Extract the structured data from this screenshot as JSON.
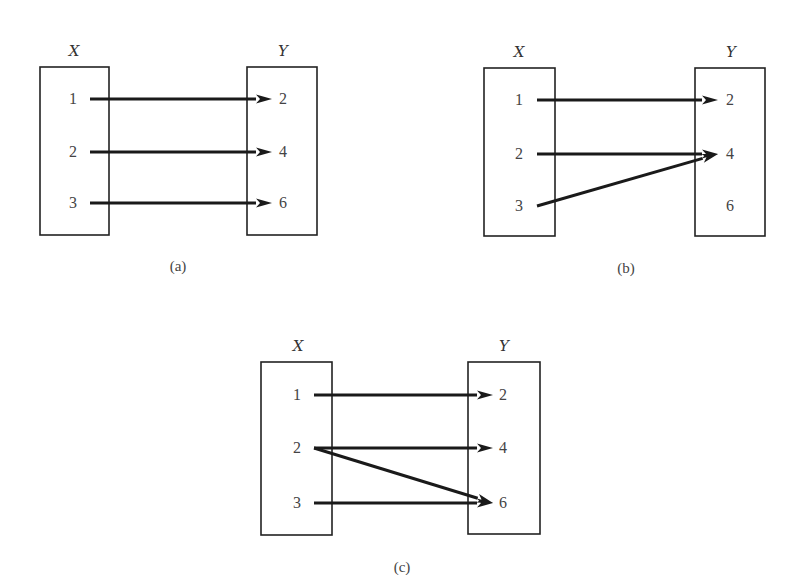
{
  "figure": {
    "background": "#ffffff",
    "line_color": "#1a1a1a",
    "panels": [
      {
        "id": "a",
        "caption": "(a)",
        "caption_pos": [
          178,
          271
        ],
        "domain": {
          "label": "X",
          "box": [
            40,
            67,
            69,
            168
          ],
          "label_pos": [
            74,
            56
          ],
          "elements": [
            {
              "v": "1",
              "y": 99
            },
            {
              "v": "2",
              "y": 152
            },
            {
              "v": "3",
              "y": 203
            }
          ],
          "elem_x": 73
        },
        "codomain": {
          "label": "Y",
          "box": [
            247,
            67,
            70,
            168
          ],
          "label_pos": [
            283,
            56
          ],
          "elements": [
            {
              "v": "2",
              "y": 99
            },
            {
              "v": "4",
              "y": 152
            },
            {
              "v": "6",
              "y": 203
            }
          ],
          "elem_x": 283
        },
        "mappings": [
          {
            "from": "1",
            "to": "2"
          },
          {
            "from": "2",
            "to": "4"
          },
          {
            "from": "3",
            "to": "6"
          }
        ],
        "arrow_start_x": 90,
        "arrow_end_x": 272
      },
      {
        "id": "b",
        "caption": "(b)",
        "caption_pos": [
          626,
          273
        ],
        "domain": {
          "label": "X",
          "box": [
            484,
            68,
            71,
            168
          ],
          "label_pos": [
            519,
            57
          ],
          "elements": [
            {
              "v": "1",
              "y": 100
            },
            {
              "v": "2",
              "y": 154
            },
            {
              "v": "3",
              "y": 206
            }
          ],
          "elem_x": 519
        },
        "codomain": {
          "label": "Y",
          "box": [
            695,
            68,
            70,
            168
          ],
          "label_pos": [
            731,
            57
          ],
          "elements": [
            {
              "v": "2",
              "y": 100
            },
            {
              "v": "4",
              "y": 154
            },
            {
              "v": "6",
              "y": 206
            }
          ],
          "elem_x": 730
        },
        "mappings": [
          {
            "from": "1",
            "to": "2"
          },
          {
            "from": "2",
            "to": "4"
          },
          {
            "from": "3",
            "to": "4"
          }
        ],
        "arrow_start_x": 537,
        "arrow_end_x": 718
      },
      {
        "id": "c",
        "caption": "(c)",
        "caption_pos": [
          402,
          572
        ],
        "domain": {
          "label": "X",
          "box": [
            261,
            362,
            71,
            173
          ],
          "label_pos": [
            298,
            351
          ],
          "elements": [
            {
              "v": "1",
              "y": 395
            },
            {
              "v": "2",
              "y": 448
            },
            {
              "v": "3",
              "y": 503
            }
          ],
          "elem_x": 297
        },
        "codomain": {
          "label": "Y",
          "box": [
            468,
            362,
            72,
            172
          ],
          "label_pos": [
            504,
            351
          ],
          "elements": [
            {
              "v": "2",
              "y": 395
            },
            {
              "v": "4",
              "y": 448
            },
            {
              "v": "6",
              "y": 503
            }
          ],
          "elem_x": 503
        },
        "mappings": [
          {
            "from": "1",
            "to": "2"
          },
          {
            "from": "2",
            "to": "4"
          },
          {
            "from": "2",
            "to": "6"
          },
          {
            "from": "3",
            "to": "6"
          }
        ],
        "arrow_start_x": 314,
        "arrow_end_x": 493
      }
    ]
  }
}
